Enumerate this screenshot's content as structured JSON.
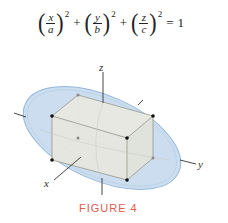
{
  "equation": {
    "terms": [
      {
        "num": "x",
        "den": "a",
        "exp": "2"
      },
      {
        "num": "y",
        "den": "b",
        "exp": "2"
      },
      {
        "num": "z",
        "den": "c",
        "exp": "2"
      }
    ],
    "plus": "+",
    "equals": "=",
    "rhs": "1"
  },
  "figure": {
    "axis_labels": {
      "x": "x",
      "y": "y",
      "z": "z"
    },
    "colors": {
      "ellipsoid_fill": "#c9dcef",
      "ellipsoid_edge": "#8fb4d8",
      "box_fill": "#e9e8dc",
      "box_edge": "#8c8c80",
      "axis": "#333333",
      "vertex_front": "#111111",
      "vertex_back": "#8a8a8a"
    }
  },
  "caption": {
    "label": "FIGURE 4",
    "color": "#e05a50"
  }
}
